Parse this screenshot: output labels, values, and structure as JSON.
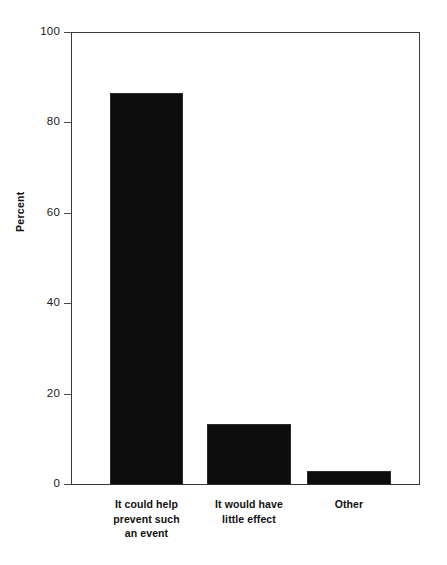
{
  "chart_data": {
    "type": "bar",
    "title": "",
    "subtitle": "",
    "xlabel": "",
    "ylabel": "Percent",
    "ylim": [
      0,
      100
    ],
    "yticks": [
      0,
      20,
      40,
      60,
      80,
      100
    ],
    "ytick_labels": [
      "0",
      "20",
      "40",
      "60",
      "80",
      "100"
    ],
    "grid": false,
    "legend": false,
    "bar_color": "#0d0d0d",
    "axis_color": "#3a3a3a",
    "background": "#ffffff",
    "categories": [
      "It could help prevent such an event",
      "It would have little effect",
      "Other"
    ],
    "category_lines": [
      [
        "It could help",
        "prevent such",
        "an event"
      ],
      [
        "It would have",
        "little effect"
      ],
      [
        "Other"
      ]
    ],
    "values": [
      86.5,
      13.5,
      3.0
    ],
    "value_unit": "percent"
  }
}
